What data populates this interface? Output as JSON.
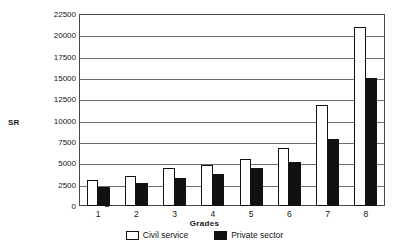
{
  "chart_data": {
    "type": "bar",
    "title": "",
    "xlabel": "Grades",
    "ylabel": "SR",
    "categories": [
      "1",
      "2",
      "3",
      "4",
      "5",
      "6",
      "7",
      "8"
    ],
    "series": [
      {
        "name": "Civil service",
        "color": "#ffffff",
        "values": [
          3100,
          3500,
          4400,
          4800,
          5500,
          6800,
          11800,
          21000
        ]
      },
      {
        "name": "Private sector",
        "color": "#111111",
        "values": [
          2200,
          2700,
          3300,
          3700,
          4400,
          5100,
          7800,
          15000
        ]
      }
    ],
    "ylim": [
      0,
      22500
    ],
    "ytick_labels": [
      "0",
      "2500",
      "5000",
      "7500",
      "10000",
      "12500",
      "15000",
      "17500",
      "20000",
      "22500"
    ],
    "ytick_values": [
      0,
      2500,
      5000,
      7500,
      10000,
      12500,
      15000,
      17500,
      20000,
      22500
    ],
    "grid": true,
    "grid_axis": "y",
    "legend_position": "bottom"
  }
}
